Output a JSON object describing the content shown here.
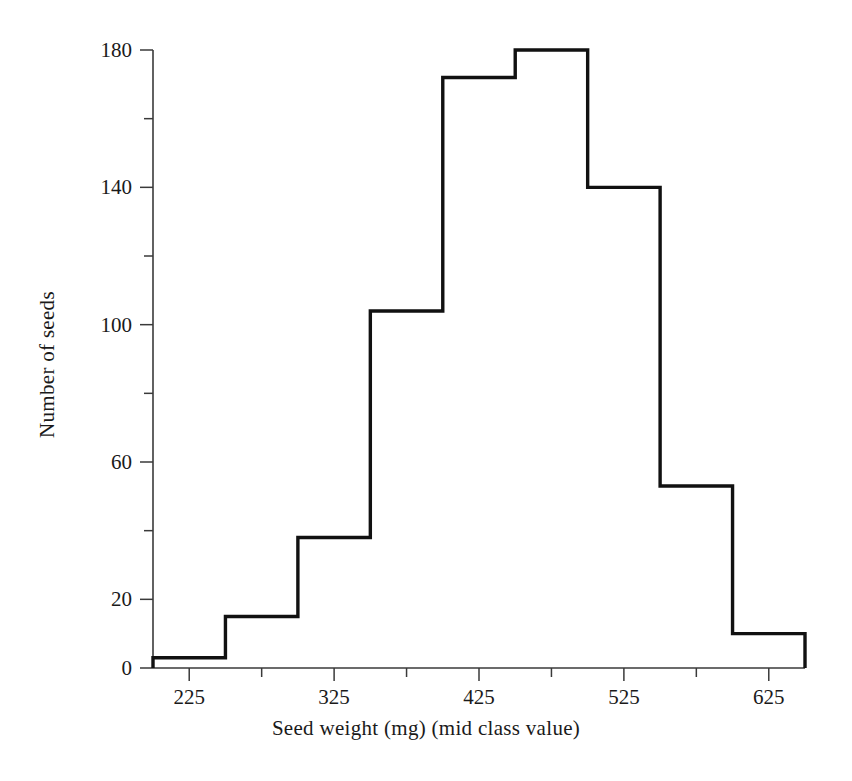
{
  "chart_data": {
    "type": "bar",
    "title": "",
    "xlabel": "Seed weight (mg) (mid class value)",
    "ylabel": "Number of seeds",
    "categories": [
      225,
      275,
      325,
      375,
      425,
      475,
      525,
      575,
      625
    ],
    "values": [
      3,
      15,
      38,
      104,
      172,
      180,
      140,
      53,
      10
    ],
    "bin_width": 50,
    "bin_edges": [
      200,
      250,
      300,
      350,
      400,
      450,
      500,
      550,
      600,
      650
    ],
    "xlim": [
      200,
      650
    ],
    "ylim": [
      0,
      180
    ],
    "x_ticks": [
      225,
      275,
      325,
      375,
      425,
      475,
      525,
      575,
      625
    ],
    "x_tick_labels": [
      "",
      "225",
      "",
      "325",
      "",
      "425",
      "",
      "525",
      "",
      "625",
      ""
    ],
    "x_major_ticks": [
      225,
      325,
      425,
      525,
      625
    ],
    "x_major_tick_labels": [
      "225",
      "325",
      "425",
      "525",
      "625"
    ],
    "y_ticks": [
      0,
      20,
      40,
      60,
      80,
      100,
      120,
      140,
      160,
      180
    ],
    "y_labeled_ticks": [
      0,
      20,
      60,
      100,
      140,
      180
    ],
    "y_tick_labels": [
      "0",
      "20",
      "60",
      "100",
      "140",
      "180"
    ],
    "grid": false,
    "legend": "none",
    "style": "step-outline histogram, unfilled, black outline on white"
  },
  "labels": {
    "y_axis_title": "Number of seeds",
    "x_axis_title": "Seed weight (mg) (mid class value)"
  },
  "colors": {
    "line": "#111111",
    "axis": "#3a3a3a",
    "background": "#ffffff",
    "text": "#1a1a1a"
  }
}
